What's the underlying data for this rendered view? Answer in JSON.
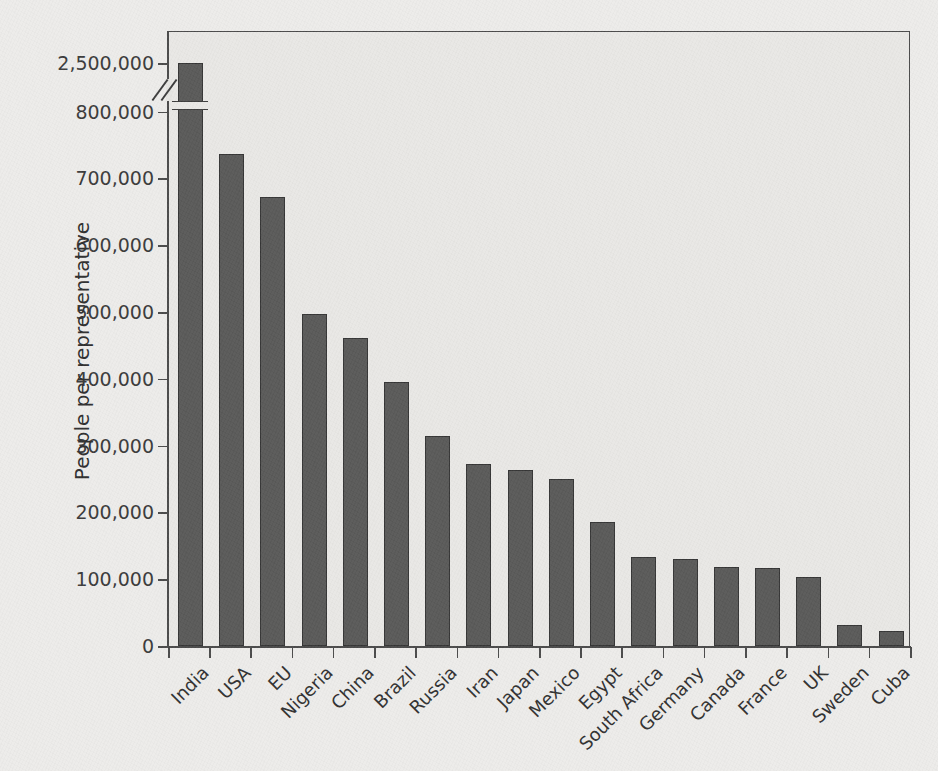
{
  "chart_data": {
    "type": "bar",
    "title": "",
    "xlabel": "",
    "ylabel": "People per representative",
    "categories": [
      "India",
      "USA",
      "EU",
      "Nigeria",
      "China",
      "Brazil",
      "Russia",
      "Iran",
      "Japan",
      "Mexico",
      "Egypt",
      "South Africa",
      "Germany",
      "Canada",
      "France",
      "UK",
      "Sweden",
      "Cuba"
    ],
    "values": [
      2500000,
      737000,
      672000,
      497000,
      461000,
      395000,
      314000,
      272000,
      264000,
      250000,
      186000,
      133000,
      130000,
      118000,
      117000,
      103000,
      31000,
      22000
    ],
    "value_labels": [
      "2,500,000",
      "737,000",
      "672,000",
      "497,000",
      "461,000",
      "395,000",
      "314,000",
      "272,000",
      "264,000",
      "250,000",
      "186,000",
      "133,000",
      "130,000",
      "118,000",
      "117,000",
      "103,000",
      "31,000",
      "22,000"
    ],
    "ytick_labels": [
      "0",
      "100,000",
      "200,000",
      "300,000",
      "400,000",
      "500,000",
      "600,000",
      "700,000",
      "800,000",
      "2,500,000"
    ],
    "ytick_values": [
      0,
      100000,
      200000,
      300000,
      400000,
      500000,
      600000,
      700000,
      800000,
      2500000
    ],
    "ylim": [
      0,
      2500000
    ],
    "axis_break": {
      "present": true,
      "between": [
        800000,
        2500000
      ],
      "marker": "double-slash",
      "note": "Y axis is broken between 800,000 and 2,500,000; the India bar is interrupted by a matching break."
    },
    "grid": false,
    "legend": null,
    "legend_position": "none",
    "bar_color": "#595958",
    "bar_edge_color": "#343434",
    "plot_background": "#e9e8e5",
    "axis_color": "#4a4a4a",
    "xlabel_rotation": -45
  },
  "scan": {
    "top_cut_text": "",
    "bottom_cut_text": ""
  }
}
